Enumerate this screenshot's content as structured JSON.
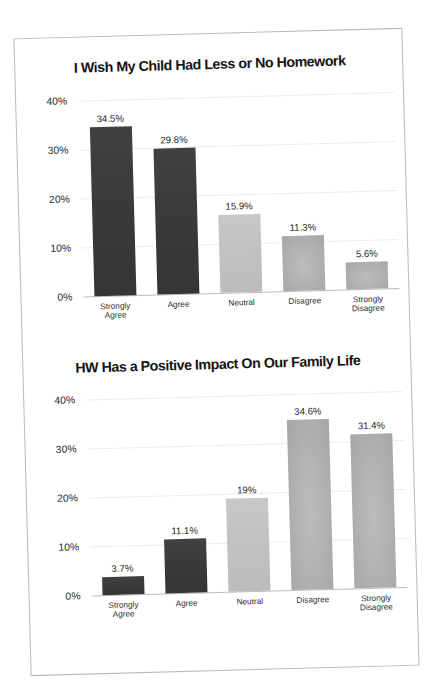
{
  "page": {
    "background": "#ffffff",
    "sheet_border_color": "#b9b9b9"
  },
  "charts": [
    {
      "id": "chart-homework-less",
      "title": "I Wish My Child Had Less or No Homework",
      "chart_data": {
        "type": "bar",
        "title": "I Wish My Child Had Less or No Homework",
        "xlabel": "",
        "ylabel": "",
        "ylim": [
          0,
          40
        ],
        "ytick_labels": [
          "0%",
          "10%",
          "20%",
          "30%",
          "40%"
        ],
        "ytick_values": [
          0,
          10,
          20,
          30,
          40
        ],
        "grid": true,
        "legend": "none",
        "categories": [
          "Strongly Agree",
          "Agree",
          "Neutral",
          "Disagree",
          "Strongly Disagree"
        ],
        "values": [
          34.5,
          29.8,
          15.9,
          11.3,
          5.6
        ],
        "value_labels": [
          "34.5%",
          "29.8%",
          "15.9%",
          "11.3%",
          "5.6%"
        ],
        "bar_colors": [
          "#3a3a3a",
          "#3a3a3a",
          "#c1c1c1",
          "#b0b0b0",
          "#b0b0b0"
        ]
      }
    },
    {
      "id": "chart-homework-family-life",
      "title": "HW Has a Positive Impact On Our Family Life",
      "chart_data": {
        "type": "bar",
        "title": "HW Has a Positive Impact On Our Family Life",
        "xlabel": "",
        "ylabel": "",
        "ylim": [
          0,
          40
        ],
        "ytick_labels": [
          "0%",
          "10%",
          "20%",
          "30%",
          "40%"
        ],
        "ytick_values": [
          0,
          10,
          20,
          30,
          40
        ],
        "grid": true,
        "legend": "none",
        "categories": [
          "Strongly Agree",
          "Agree",
          "Neutral",
          "Disagree",
          "Strongly Disagree"
        ],
        "values": [
          3.7,
          11.1,
          19.0,
          34.6,
          31.4
        ],
        "value_labels": [
          "3.7%",
          "11.1%",
          "19%",
          "34.6%",
          "31.4%"
        ],
        "bar_colors": [
          "#3a3a3a",
          "#3a3a3a",
          "#c1c1c1",
          "#b0b0b0",
          "#b0b0b0"
        ]
      }
    }
  ]
}
